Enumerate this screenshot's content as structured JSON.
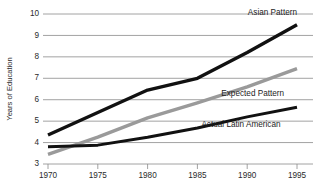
{
  "chart_data": {
    "type": "line",
    "title": "",
    "subtitle": "",
    "xlabel": "",
    "ylabel": "Years of Education",
    "x": [
      1970,
      1975,
      1980,
      1985,
      1990,
      1995
    ],
    "categories": [
      "1970",
      "1975",
      "1980",
      "1985",
      "1990",
      "1995"
    ],
    "xlim": [
      1970,
      1995
    ],
    "ylim": [
      3,
      10
    ],
    "yticks": [
      3,
      4,
      5,
      6,
      7,
      8,
      9,
      10
    ],
    "ytick_labels": [
      "3",
      "4",
      "5",
      "6",
      "7",
      "8",
      "9",
      "10"
    ],
    "xticks": [
      1970,
      1975,
      1980,
      1985,
      1990,
      1995
    ],
    "xtick_labels": [
      "1970",
      "1975",
      "1980",
      "1985",
      "1990",
      "1995"
    ],
    "grid": "horizontal",
    "legend_position": "inline-right",
    "series": [
      {
        "name": "Asian Pattern",
        "color": "#111111",
        "style": "thick-black",
        "values": [
          4.35,
          5.4,
          6.45,
          7.0,
          8.2,
          9.5
        ],
        "label": "Asian Pattern",
        "label_anchor": "end",
        "label_x": 1995,
        "label_y": 9.95
      },
      {
        "name": "Expected Pattern",
        "color": "#9a9a9a",
        "style": "thick-gray",
        "values": [
          3.45,
          4.25,
          5.15,
          5.85,
          6.6,
          7.45
        ],
        "label": "Expected Pattern",
        "label_anchor": "start",
        "label_x": 1987.4,
        "label_y": 6.18
      },
      {
        "name": "Actual Latin American",
        "color": "#111111",
        "style": "thick-black-thin",
        "values": [
          3.8,
          3.88,
          4.25,
          4.68,
          5.2,
          5.65
        ],
        "label": "Actual Latin American",
        "label_anchor": "start",
        "label_x": 1985.4,
        "label_y": 4.72
      }
    ]
  }
}
